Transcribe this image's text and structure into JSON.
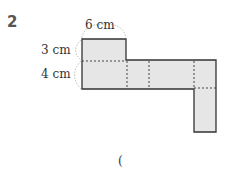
{
  "problem": {
    "number": "2",
    "labels": {
      "width": "6 cm",
      "height_top": "3 cm",
      "height_bottom": "4 cm"
    },
    "answer_paren": "("
  },
  "colors": {
    "fill": "#e6e6e6",
    "stroke": "#333333",
    "dashed": "#444444",
    "brace": "#bbbbbb"
  }
}
